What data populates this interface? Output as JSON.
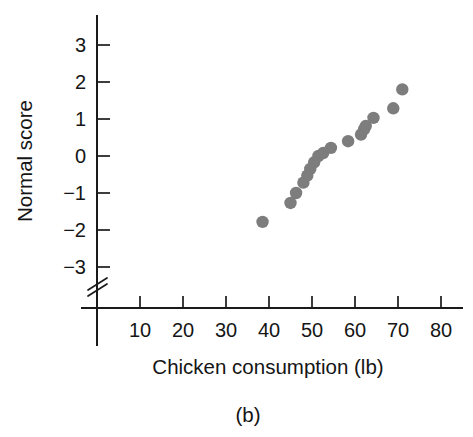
{
  "caption": "(b)",
  "colors": {
    "point": "#7d7d7d",
    "axis": "#1a1a1a",
    "text": "#151515",
    "background": "#ffffff"
  },
  "axes": {
    "x_title": "Chicken consumption (lb)",
    "y_title": "Normal score",
    "x_ticks": [
      "10",
      "20",
      "30",
      "40",
      "50",
      "60",
      "70",
      "80"
    ],
    "y_ticks": [
      "3",
      "2",
      "1",
      "0",
      "−1",
      "−2",
      "−3"
    ],
    "y_axis_break": true
  },
  "chart_data": {
    "type": "scatter",
    "title": "",
    "subtitle": "",
    "xlabel": "Chicken consumption (lb)",
    "ylabel": "Normal score",
    "xlim": [
      0,
      85
    ],
    "ylim": [
      -3.6,
      3.6
    ],
    "xticks": [
      10,
      20,
      30,
      40,
      50,
      60,
      70,
      80
    ],
    "yticks": [
      3,
      2,
      1,
      0,
      -1,
      -2,
      -3
    ],
    "grid": false,
    "legend": false,
    "axis_break_y": "below -3",
    "series": [
      {
        "name": "Chicken consumption normal probability plot",
        "marker": "circle",
        "color": "#7d7d7d",
        "points": [
          {
            "x": 38.5,
            "y": -1.78
          },
          {
            "x": 45.0,
            "y": -1.27
          },
          {
            "x": 46.3,
            "y": -1.0
          },
          {
            "x": 48.0,
            "y": -0.72
          },
          {
            "x": 48.9,
            "y": -0.53
          },
          {
            "x": 49.6,
            "y": -0.35
          },
          {
            "x": 50.5,
            "y": -0.17
          },
          {
            "x": 51.5,
            "y": 0.0
          },
          {
            "x": 52.6,
            "y": 0.08
          },
          {
            "x": 54.4,
            "y": 0.22
          },
          {
            "x": 58.4,
            "y": 0.4
          },
          {
            "x": 61.4,
            "y": 0.58
          },
          {
            "x": 62.1,
            "y": 0.72
          },
          {
            "x": 62.5,
            "y": 0.81
          },
          {
            "x": 64.3,
            "y": 1.03
          },
          {
            "x": 68.9,
            "y": 1.29
          },
          {
            "x": 71.0,
            "y": 1.8
          }
        ]
      }
    ]
  }
}
